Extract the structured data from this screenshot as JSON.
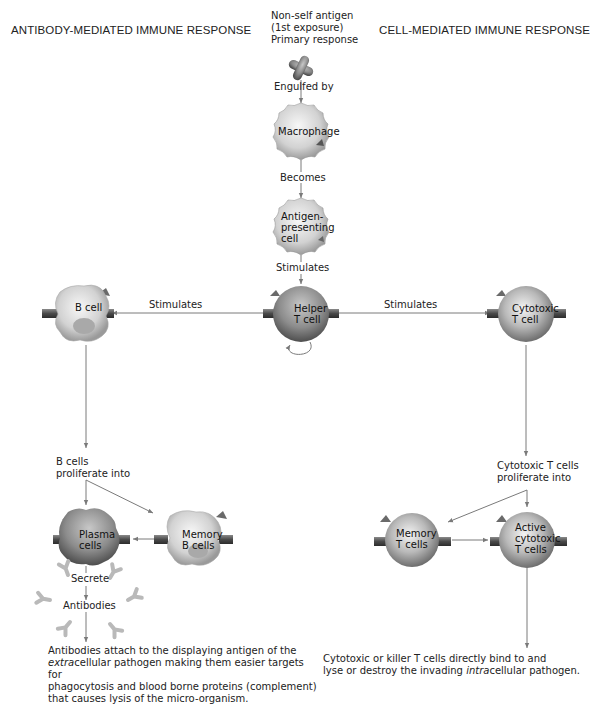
{
  "headings": {
    "left": "ANTIBODY-MEDIATED IMMUNE RESPONSE",
    "right": "CELL-MEDIATED IMMUNE RESPONSE"
  },
  "antigen": {
    "line1": "Non-self antigen",
    "line2": "(1st exposure)",
    "line3": "Primary response"
  },
  "labels": {
    "engulfed_by": "Engulfed by",
    "becomes": "Becomes",
    "stimulates_top": "Stimulates",
    "stimulates_left": "Stimulates",
    "stimulates_right": "Stimulates",
    "b_proliferate_1": "B cells",
    "b_proliferate_2": "proliferate into",
    "secrete": "Secrete",
    "antibodies": "Antibodies",
    "t_proliferate_1": "Cytotoxic T cells",
    "t_proliferate_2": "proliferate into"
  },
  "cells": {
    "macrophage": {
      "line1": "Macrophage"
    },
    "apc": {
      "line1": "Antigen-",
      "line2": "presenting",
      "line3": "cell"
    },
    "helper": {
      "line1": "Helper",
      "line2": "T cell"
    },
    "bcell": {
      "line1": "B cell"
    },
    "cytotoxic": {
      "line1": "Cytotoxic",
      "line2": "T cell"
    },
    "plasma": {
      "line1": "Plasma",
      "line2": "cells"
    },
    "memory_b": {
      "line1": "Memory",
      "line2": "B cells"
    },
    "memory_t": {
      "line1": "Memory",
      "line2": "T cells"
    },
    "active_cyto": {
      "line1": "Active",
      "line2": "cytotoxic",
      "line3": "T cells"
    }
  },
  "outcomes": {
    "left": {
      "l1": "Antibodies attach to the displaying antigen of the",
      "l2_italic": "extra",
      "l2_rest": "cellular pathogen making them easier targets for",
      "l3": "phagocytosis and blood borne proteins (complement)",
      "l4": "that causes lysis of the micro-organism."
    },
    "right": {
      "l1": "Cytotoxic or killer T cells directly bind to and",
      "l2_pre": "lyse or destroy the invading ",
      "l2_italic": "intra",
      "l2_rest": "cellular pathogen."
    }
  },
  "colors": {
    "line": "#7a7a7a",
    "cell_light": "#e6e6e6",
    "cell_mid": "#b8b8b8",
    "cell_dark": "#7d7d7d",
    "receptor": "#555555"
  }
}
